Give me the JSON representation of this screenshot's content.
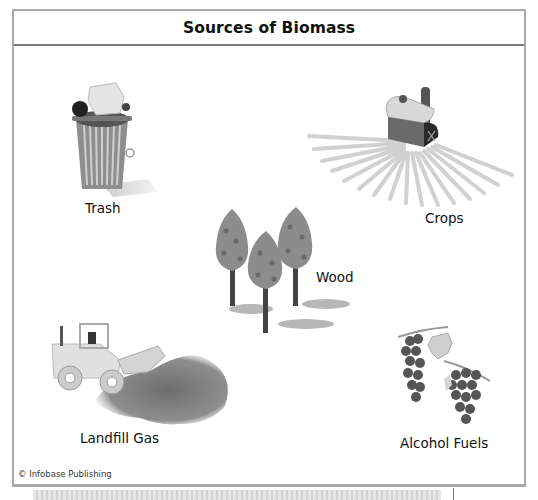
{
  "diagram": {
    "title": "Sources of Biomass",
    "items": [
      {
        "id": "trash",
        "label": "Trash",
        "icon": "trash-can-icon"
      },
      {
        "id": "crops",
        "label": "Crops",
        "icon": "barn-field-icon"
      },
      {
        "id": "wood",
        "label": "Wood",
        "icon": "trees-icon"
      },
      {
        "id": "landfill-gas",
        "label": "Landfill Gas",
        "icon": "bulldozer-icon"
      },
      {
        "id": "alcohol-fuels",
        "label": "Alcohol Fuels",
        "icon": "grapes-icon"
      }
    ],
    "credit": "© Infobase Publishing"
  },
  "colors": {
    "frame_border": "#a9a9a9",
    "divider": "#7a7a7a",
    "illustration_gray": "#8a8a8a",
    "dark_gray": "#4a4a4a"
  }
}
